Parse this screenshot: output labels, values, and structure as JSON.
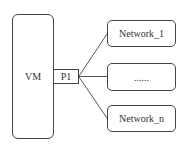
{
  "diagram": {
    "vm": {
      "label": "VM"
    },
    "port": {
      "label": "P1"
    },
    "networks": [
      {
        "label": "Network_1"
      },
      {
        "label": "......"
      },
      {
        "label": "Network_n"
      }
    ],
    "colors": {
      "stroke": "#444444",
      "background": "#ffffff",
      "text": "#333333"
    }
  }
}
